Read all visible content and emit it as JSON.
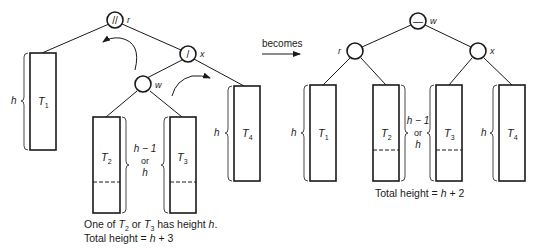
{
  "before": {
    "nodes": {
      "r": {
        "label": "r",
        "glyph": "//"
      },
      "x": {
        "label": "x",
        "glyph": "/"
      },
      "w": {
        "label": "w",
        "glyph": ""
      }
    },
    "subtrees": [
      {
        "name": "T",
        "sub": "1",
        "height_label": "h"
      },
      {
        "name": "T",
        "sub": "2"
      },
      {
        "name": "T",
        "sub": "3"
      },
      {
        "name": "T",
        "sub": "4",
        "height_label": "h"
      }
    ],
    "middle_height_label": {
      "line1": "h − 1",
      "line2": "or",
      "line3": "h"
    },
    "caption": {
      "line1_pre": "One of ",
      "t2": "T",
      "t2_sub": "2",
      "or": " or ",
      "t3": "T",
      "t3_sub": "3",
      "line1_post": " has height ",
      "h": "h",
      "period": ".",
      "line2_pre": "Total height = ",
      "line2_h": "h",
      "line2_post": " + 3"
    }
  },
  "transition": {
    "label": "becomes"
  },
  "after": {
    "nodes": {
      "w": {
        "label": "w",
        "glyph": "—"
      },
      "r": {
        "label": "r",
        "glyph": ""
      },
      "x": {
        "label": "x",
        "glyph": ""
      }
    },
    "subtrees": [
      {
        "name": "T",
        "sub": "1",
        "height_label": "h"
      },
      {
        "name": "T",
        "sub": "2"
      },
      {
        "name": "T",
        "sub": "3"
      },
      {
        "name": "T",
        "sub": "4",
        "height_label": "h"
      }
    ],
    "middle_height_label": {
      "line1": "h − 1",
      "line2": "or",
      "line3": "h"
    },
    "caption": {
      "pre": "Total height = ",
      "h": "h",
      "post": " + 2"
    }
  }
}
